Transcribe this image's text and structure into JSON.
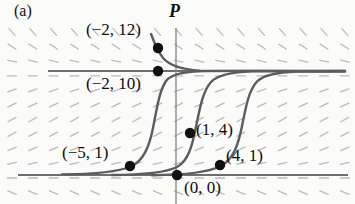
{
  "figure": {
    "panel_label": "(a)",
    "axis_label_P": "P",
    "background": "#fbfbfa",
    "curve_color": "#5a5a5a",
    "line_color": "#6b6b6b",
    "dot_color": "#111111",
    "field_color": "#b9b9b9"
  },
  "annotations": [
    {
      "text": "(−2, 12)",
      "x": 86,
      "y": 20
    },
    {
      "text": "(−2, 10)",
      "x": 86,
      "y": 74
    },
    {
      "text": "(−5, 1)",
      "x": 62,
      "y": 143
    },
    {
      "text": "(1, 4)",
      "x": 196,
      "y": 120
    },
    {
      "text": "(4, 1)",
      "x": 226,
      "y": 146
    },
    {
      "text": "(0, 0)",
      "x": 184,
      "y": 178
    }
  ],
  "chart_data": {
    "type": "line",
    "title": "",
    "subtitle": "",
    "xlabel": "",
    "ylabel": "P",
    "grid": false,
    "legend": null,
    "equilibria": [
      {
        "P": 10,
        "label": "(−2, 10)",
        "style": "stable",
        "y_px": 71
      },
      {
        "P": 0,
        "label": "(0, 0)",
        "style": "unstable",
        "y_px": 175
      }
    ],
    "marked_points": [
      {
        "label": "(−2, 12)",
        "t": -2,
        "P": 12,
        "x_px": 158,
        "y_px": 48
      },
      {
        "label": "(−2, 10)",
        "t": -2,
        "P": 10,
        "x_px": 158,
        "y_px": 71
      },
      {
        "label": "(−5, 1)",
        "t": -5,
        "P": 1,
        "x_px": 130,
        "y_px": 166
      },
      {
        "label": "(1, 4)",
        "t": 1,
        "P": 4,
        "x_px": 190,
        "y_px": 133
      },
      {
        "label": "(4, 1)",
        "t": 4,
        "P": 1,
        "x_px": 220,
        "y_px": 165
      },
      {
        "label": "(0, 0)",
        "t": 0,
        "P": 0,
        "x_px": 177,
        "y_px": 175
      }
    ],
    "solution_curves": [
      {
        "name": "through (−2, 12)",
        "through": "(−2, 12)",
        "asymptote": 10,
        "from_above": true
      },
      {
        "name": "through (−5, 1)",
        "through": "(−5, 1)",
        "asymptote": 10,
        "from_above": false
      },
      {
        "name": "through (1, 4)",
        "through": "(1, 4)",
        "asymptote": 10,
        "from_above": false
      },
      {
        "name": "through (4, 1)",
        "through": "(4, 1)",
        "asymptote": 10,
        "from_above": false
      }
    ],
    "axis_vertical_x_px": 176,
    "field_band_slopes": [
      {
        "region": "P > 10",
        "slope_sign": "negative",
        "appearance": "steep backslash"
      },
      {
        "region": "P = 10",
        "slope_sign": "zero",
        "appearance": "horizontal dash"
      },
      {
        "region": "0 < P < 10",
        "slope_sign": "positive",
        "appearance": "steep forward slash"
      },
      {
        "region": "P = 0",
        "slope_sign": "zero",
        "appearance": "horizontal dash"
      },
      {
        "region": "P < 0",
        "slope_sign": "negative",
        "appearance": "backslash"
      }
    ]
  }
}
